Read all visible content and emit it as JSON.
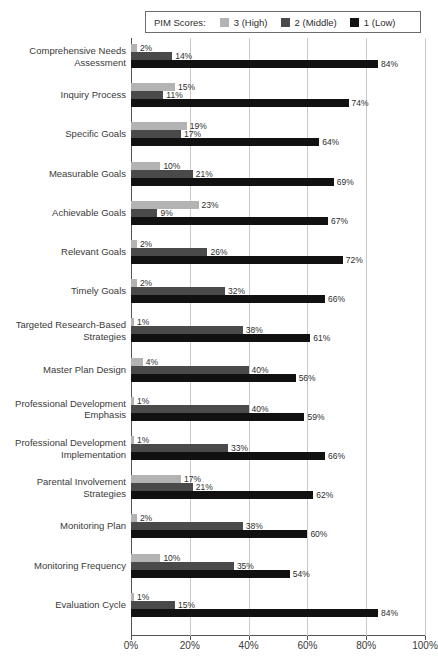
{
  "legend": {
    "title": "PIM Scores:",
    "entries": [
      {
        "label": "3 (High)",
        "color": "#b3b3b3",
        "series": "3"
      },
      {
        "label": "2 (Middle)",
        "color": "#4a4a4a",
        "series": "2"
      },
      {
        "label": "1 (Low)",
        "color": "#111111",
        "series": "1"
      }
    ]
  },
  "chart_data": {
    "type": "bar",
    "orientation": "horizontal",
    "title": "",
    "xlabel": "",
    "ylabel": "",
    "xlim": [
      0,
      100
    ],
    "xticks": [
      "0%",
      "20%",
      "40%",
      "60%",
      "80%",
      "100%"
    ],
    "xtick_values": [
      0,
      20,
      40,
      60,
      80,
      100
    ],
    "grid": true,
    "legend_position": "top",
    "value_suffix": "%",
    "categories": [
      "Comprehensive Needs Assessment",
      "Inquiry Process",
      "Specific Goals",
      "Measurable Goals",
      "Achievable Goals",
      "Relevant Goals",
      "Timely Goals",
      "Targeted Research-Based Strategies",
      "Master Plan Design",
      "Professional Development Emphasis",
      "Professional Development Implementation",
      "Parental Involvement Strategies",
      "Monitoring Plan",
      "Monitoring Frequency",
      "Evaluation Cycle"
    ],
    "category_lines": [
      [
        "Comprehensive Needs",
        "Assessment"
      ],
      [
        "Inquiry Process"
      ],
      [
        "Specific Goals"
      ],
      [
        "Measurable Goals"
      ],
      [
        "Achievable Goals"
      ],
      [
        "Relevant Goals"
      ],
      [
        "Timely Goals"
      ],
      [
        "Targeted Research-Based",
        "Strategies"
      ],
      [
        "Master Plan Design"
      ],
      [
        "Professional Development",
        "Emphasis"
      ],
      [
        "Professional Development",
        "Implementation"
      ],
      [
        "Parental Involvement",
        "Strategies"
      ],
      [
        "Monitoring Plan"
      ],
      [
        "Monitoring Frequency"
      ],
      [
        "Evaluation Cycle"
      ]
    ],
    "series": [
      {
        "name": "3 (High)",
        "color": "#b3b3b3",
        "values": [
          2,
          15,
          19,
          10,
          23,
          2,
          2,
          1,
          4,
          1,
          1,
          17,
          2,
          10,
          1
        ],
        "labels": [
          "2%",
          "15%",
          "19%",
          "10%",
          "23%",
          "2%",
          "2%",
          "1%",
          "4%",
          "1%",
          "1%",
          "17%",
          "2%",
          "10%",
          "1%"
        ]
      },
      {
        "name": "2 (Middle)",
        "color": "#4a4a4a",
        "values": [
          14,
          11,
          17,
          21,
          9,
          26,
          32,
          38,
          40,
          40,
          33,
          21,
          38,
          35,
          15
        ],
        "labels": [
          "14%",
          "11%",
          "17%",
          "21%",
          "9%",
          "26%",
          "32%",
          "38%",
          "40%",
          "40%",
          "33%",
          "21%",
          "38%",
          "35%",
          "15%"
        ]
      },
      {
        "name": "1 (Low)",
        "color": "#111111",
        "values": [
          84,
          74,
          64,
          69,
          67,
          72,
          66,
          61,
          56,
          59,
          66,
          62,
          60,
          54,
          84
        ],
        "labels": [
          "84%",
          "74%",
          "64%",
          "69%",
          "67%",
          "72%",
          "66%",
          "61%",
          "56%",
          "59%",
          "66%",
          "62%",
          "60%",
          "54%",
          "84%"
        ]
      }
    ]
  }
}
